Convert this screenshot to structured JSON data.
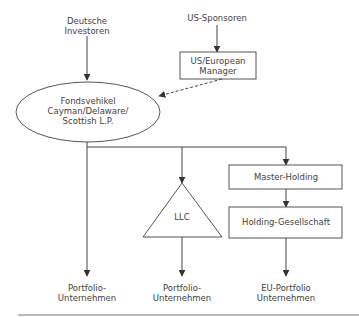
{
  "diagram": {
    "top_left_source": {
      "line1": "Deutsche",
      "line2": "Investoren"
    },
    "top_right_source": "US-Sponsoren",
    "manager_box": {
      "line1": "US/European",
      "line2": "Manager"
    },
    "fund_vehicle": {
      "line1": "Fondsvehikel",
      "line2": "Cayman/Delaware/",
      "line3": "Scottish L.P."
    },
    "llc": "LLC",
    "master_holding": "Master-Holding",
    "holding_company": "Holding-Gesellschaft",
    "targets": [
      {
        "line1": "Portfolio-",
        "line2": "Unternehmen"
      },
      {
        "line1": "Portfolio-",
        "line2": "Unternehmen"
      },
      {
        "line1": "EU-Portfolio",
        "line2": "Unternehmen"
      }
    ]
  }
}
